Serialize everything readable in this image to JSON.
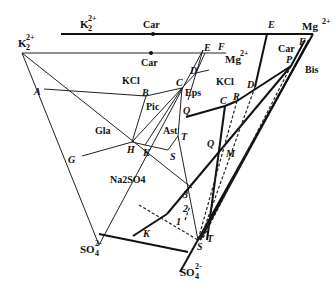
{
  "diagram": {
    "ions": {
      "k2_top": {
        "base": "K",
        "sub": "2",
        "sup": "2+"
      },
      "k2_left": {
        "base": "K",
        "sub": "2",
        "sup": "2+"
      },
      "mg_top": {
        "base": "Mg",
        "sup": "2+"
      },
      "mg_inner": {
        "base": "Mg",
        "sup": "2+"
      },
      "so4_left": {
        "base": "SO",
        "sub": "4",
        "sup": "2-"
      },
      "so4_bottom": {
        "base": "SO",
        "sub": "4",
        "sup": "2-"
      }
    },
    "region_labels": {
      "car_top": "Car",
      "car_inner": "Car",
      "car_right": "Car",
      "kcl_left": "KCl",
      "kcl_right": "KCl",
      "eps": "Eps",
      "pic": "Pic",
      "gla": "Gla",
      "ast": "Ast",
      "na2so4": "Na2SO4",
      "bis": "Bis"
    },
    "point_labels": {
      "A": "A",
      "B": "B",
      "C_left": "C",
      "D_left": "D",
      "E_left": "E",
      "F_left": "F",
      "G": "G",
      "H": "H",
      "K_left": "K",
      "S_left": "S",
      "T_left": "T",
      "Q_left": "Q",
      "E_right": "E",
      "F_right": "F",
      "P": "P",
      "D_right": "D",
      "R": "R",
      "C_right": "C",
      "Q_right": "Q",
      "M": "M",
      "K_bottom": "K",
      "S_bottom": "S",
      "T_bottom": "T",
      "n1": "1",
      "n2": "2",
      "n3": "3"
    }
  }
}
